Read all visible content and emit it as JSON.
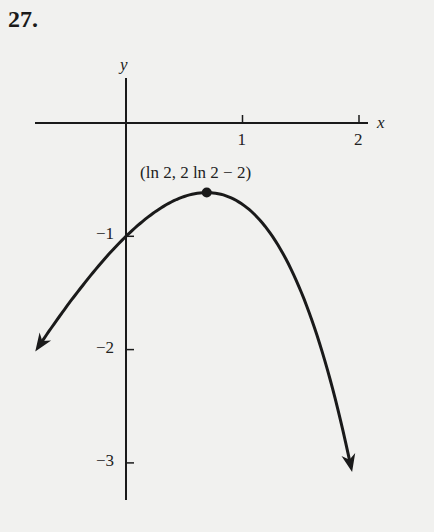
{
  "problem": {
    "number": "27."
  },
  "chart_data": {
    "type": "line",
    "title": "",
    "function": "y = 2x - e^x",
    "xlabel": "x",
    "ylabel": "y",
    "xlim": [
      -0.8,
      2.2
    ],
    "ylim": [
      -3.3,
      0.4
    ],
    "x_ticks": [
      {
        "value": 1,
        "label": "1"
      },
      {
        "value": 2,
        "label": "2"
      }
    ],
    "y_ticks": [
      {
        "value": -1,
        "label": "−1"
      },
      {
        "value": -2,
        "label": "−2"
      },
      {
        "value": -3,
        "label": "−3"
      }
    ],
    "grid": false,
    "legend": null,
    "series": [
      {
        "name": "y = 2x − e^x",
        "x_range": [
          -0.75,
          1.93
        ],
        "arrows": "both-ends",
        "sample_points": [
          {
            "x": -0.75,
            "y": -1.97
          },
          {
            "x": -0.5,
            "y": -1.61
          },
          {
            "x": 0,
            "y": -1.0
          },
          {
            "x": 0.5,
            "y": -0.65
          },
          {
            "x": 0.693,
            "y": -0.614
          },
          {
            "x": 1.0,
            "y": -0.72
          },
          {
            "x": 1.5,
            "y": -1.48
          },
          {
            "x": 1.93,
            "y": -3.03
          }
        ]
      }
    ],
    "annotations": [
      {
        "x": 0.693,
        "y": -0.614,
        "label": "(ln 2, 2 ln 2 − 2)",
        "marker": "filled-circle"
      }
    ]
  },
  "colors": {
    "ink": "#1a1a1a",
    "paper": "#f1f1ef"
  }
}
